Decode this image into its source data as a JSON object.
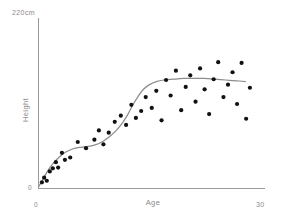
{
  "chart_data": {
    "type": "scatter",
    "title": "",
    "xlabel": "Age",
    "ylabel": "Height",
    "y_unit_label": "220cm",
    "x_tick_labels": [
      "0",
      "30"
    ],
    "y_tick_labels": [
      "0",
      "220cm"
    ],
    "xlim": [
      0,
      30
    ],
    "ylim": [
      0,
      220
    ],
    "grid": false,
    "legend": "none",
    "series": [
      {
        "name": "Observations",
        "type": "scatter",
        "marker": "filled-circle",
        "color": "#111111",
        "points": [
          [
            0.45,
            8
          ],
          [
            0.75,
            14
          ],
          [
            1.1,
            10
          ],
          [
            1.5,
            22
          ],
          [
            1.9,
            26
          ],
          [
            2.3,
            34
          ],
          [
            2.6,
            27
          ],
          [
            3.1,
            46
          ],
          [
            3.5,
            37
          ],
          [
            4.2,
            40
          ],
          [
            5.2,
            60
          ],
          [
            6.3,
            52
          ],
          [
            7.4,
            63
          ],
          [
            8.0,
            75
          ],
          [
            8.6,
            57
          ],
          [
            9.3,
            72
          ],
          [
            10.1,
            86
          ],
          [
            10.9,
            94
          ],
          [
            11.6,
            82
          ],
          [
            12.3,
            108
          ],
          [
            12.9,
            91
          ],
          [
            13.6,
            100
          ],
          [
            14.2,
            118
          ],
          [
            15.0,
            104
          ],
          [
            15.6,
            126
          ],
          [
            16.3,
            88
          ],
          [
            16.9,
            140
          ],
          [
            17.5,
            120
          ],
          [
            18.2,
            152
          ],
          [
            18.9,
            101
          ],
          [
            19.5,
            131
          ],
          [
            20.1,
            146
          ],
          [
            20.8,
            112
          ],
          [
            21.4,
            155
          ],
          [
            22.0,
            128
          ],
          [
            22.6,
            96
          ],
          [
            23.2,
            141
          ],
          [
            23.8,
            163
          ],
          [
            24.5,
            118
          ],
          [
            25.1,
            134
          ],
          [
            25.7,
            150
          ],
          [
            26.3,
            109
          ],
          [
            26.9,
            162
          ],
          [
            27.5,
            90
          ],
          [
            28.0,
            130
          ]
        ]
      },
      {
        "name": "Fitted growth curve",
        "type": "line",
        "color": "#8c8c8c",
        "points": [
          [
            0.0,
            2
          ],
          [
            0.6,
            12
          ],
          [
            1.3,
            24
          ],
          [
            2.0,
            33
          ],
          [
            2.8,
            41
          ],
          [
            3.6,
            47
          ],
          [
            4.5,
            51
          ],
          [
            5.4,
            53
          ],
          [
            6.4,
            54
          ],
          [
            7.4,
            56
          ],
          [
            8.4,
            60
          ],
          [
            9.3,
            66
          ],
          [
            10.2,
            74
          ],
          [
            11.0,
            83
          ],
          [
            11.8,
            95
          ],
          [
            12.5,
            108
          ],
          [
            13.2,
            119
          ],
          [
            13.9,
            128
          ],
          [
            14.7,
            134
          ],
          [
            15.6,
            138
          ],
          [
            16.6,
            140
          ],
          [
            17.8,
            141
          ],
          [
            19.2,
            142
          ],
          [
            20.6,
            142
          ],
          [
            22.0,
            142
          ],
          [
            23.4,
            141
          ],
          [
            24.8,
            140
          ],
          [
            26.2,
            139
          ],
          [
            27.4,
            138
          ]
        ]
      }
    ]
  },
  "axes": {
    "y_top_label": "220cm",
    "y_zero_label": "0",
    "x_zero_label": "0",
    "x_max_label": "30",
    "x_title": "Age",
    "y_title": "Height"
  },
  "colors": {
    "background": "#ffffff",
    "axis": "#9a9a9a",
    "curve": "#8c8c8c",
    "dot": "#111111",
    "label_text": "#8a8a8a"
  }
}
